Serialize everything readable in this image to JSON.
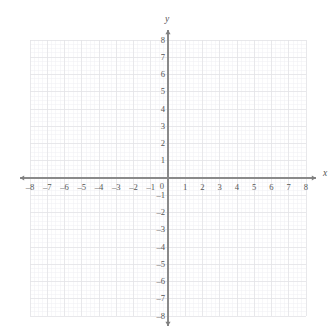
{
  "figure": {
    "kind": "cartesian-coordinate-grid",
    "width": 335,
    "height": 336,
    "background_color": "#ffffff"
  },
  "chart_data": {
    "type": "scatter",
    "title": "",
    "subtitle": "",
    "xlabel": "x",
    "ylabel": "y",
    "xlim": [
      -8,
      8
    ],
    "ylim": [
      -8,
      8
    ],
    "x_tick_labels": [
      "–8",
      "–7",
      "–6",
      "–5",
      "–4",
      "–3",
      "–2",
      "–1",
      "0",
      "1",
      "2",
      "3",
      "4",
      "5",
      "6",
      "7",
      "8"
    ],
    "x_tick_values": [
      -8,
      -7,
      -6,
      -5,
      -4,
      -3,
      -2,
      -1,
      0,
      1,
      2,
      3,
      4,
      5,
      6,
      7,
      8
    ],
    "y_tick_labels": [
      "8",
      "7",
      "6",
      "5",
      "4",
      "3",
      "2",
      "1",
      "–1",
      "–2",
      "–3",
      "–4",
      "–5",
      "–6",
      "–7",
      "–8"
    ],
    "y_tick_values": [
      8,
      7,
      6,
      5,
      4,
      3,
      2,
      1,
      -1,
      -2,
      -3,
      -4,
      -5,
      -6,
      -7,
      -8
    ],
    "origin_label": "0",
    "grid": true,
    "minor_grid": true,
    "minor_subdivisions": 4,
    "legend": null,
    "series": [],
    "annotations": [],
    "axis_arrows": [
      "left",
      "right",
      "up",
      "down"
    ]
  },
  "style": {
    "axis_color": "#8a8a8a",
    "major_grid_color": "#e2e2e6",
    "minor_grid_color": "#f0f0f3",
    "label_color": "#555555",
    "arrow_color": "#7f7f7f"
  }
}
